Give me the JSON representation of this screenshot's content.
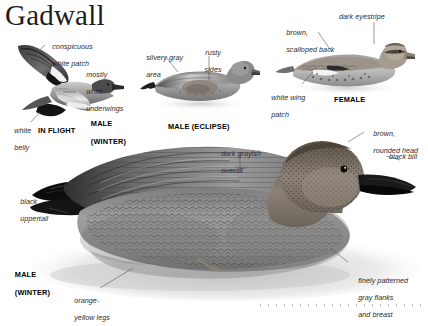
{
  "page": {
    "title": "Gadwall",
    "background_color": "#ffffff",
    "text_color": "#2b2b2b"
  },
  "plates": [
    {
      "id": "in-flight",
      "caption": "IN FLIGHT",
      "sub_caption_line1": "MALE",
      "sub_caption_line2": "(WINTER)",
      "callouts": [
        {
          "id": "conspicuous-white-patch",
          "line1": "conspicuous",
          "line2": "white patch"
        },
        {
          "id": "mostly-white-underwings",
          "line1": "mostly",
          "line2": "white",
          "line3": "underwings"
        },
        {
          "id": "white-belly",
          "line1": "white",
          "line2": "belly"
        }
      ]
    },
    {
      "id": "male-eclipse",
      "caption": "MALE (ECLIPSE)",
      "callouts": [
        {
          "id": "silvery-gray-area",
          "line1": "silvery gray",
          "line2": "area"
        },
        {
          "id": "rusty-sides",
          "line1": "rusty",
          "line2": "sides"
        }
      ]
    },
    {
      "id": "female",
      "caption": "FEMALE",
      "callouts": [
        {
          "id": "brown-scalloped-back",
          "line1": "brown,",
          "line2": "scalloped back"
        },
        {
          "id": "dark-eyestripe",
          "line1": "dark eyestripe"
        },
        {
          "id": "white-wing-patch",
          "line1": "white wing",
          "line2": "patch"
        }
      ]
    },
    {
      "id": "male-winter-swimming",
      "caption_line1": "MALE",
      "caption_line2": "(WINTER)",
      "callouts": [
        {
          "id": "black-uppertail",
          "line1": "black",
          "line2": "uppertail"
        },
        {
          "id": "dark-grayish-overall",
          "line1": "dark grayish",
          "line2": "overall"
        },
        {
          "id": "brown-rounded-head",
          "line1": "brown,",
          "line2": "rounded head"
        },
        {
          "id": "black-bill",
          "line1": "black bill"
        },
        {
          "id": "finely-patterned-gray-flanks",
          "line1": "finely patterned",
          "line2": "gray flanks",
          "line3": "and breast"
        },
        {
          "id": "orange-yellow-legs",
          "line1": "orange-",
          "line2": "yellow legs"
        }
      ]
    }
  ]
}
